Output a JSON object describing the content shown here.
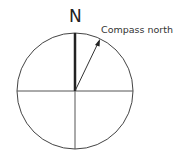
{
  "diagram": {
    "north_label": "N",
    "arrow_label": "Compass north",
    "colors": {
      "stroke": "#333333",
      "background": "#ffffff"
    }
  }
}
